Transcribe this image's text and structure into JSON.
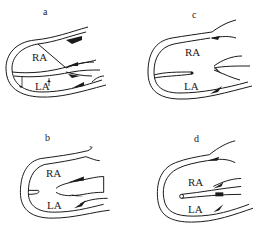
{
  "panels": [
    {
      "id": "a",
      "label": "a",
      "upper": "RA",
      "lower": "LA"
    },
    {
      "id": "c",
      "label": "c",
      "upper": "RA",
      "lower": "LA"
    },
    {
      "id": "b",
      "label": "b",
      "upper": "RA",
      "lower": "LA"
    },
    {
      "id": "d",
      "label": "d",
      "upper": "RA",
      "lower": "LA"
    }
  ],
  "colors": {
    "stroke": "#1a1a1a",
    "background": "#ffffff"
  }
}
